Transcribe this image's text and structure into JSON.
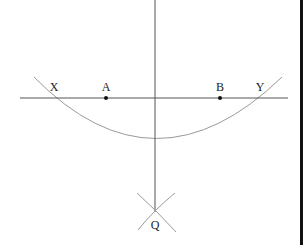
{
  "diagram": {
    "colors": {
      "line": "#555555",
      "arc": "#9a9a9a",
      "point": "#111111",
      "label": "#222222",
      "edge_bar": "#111111"
    },
    "horizontal_line": {
      "x1": 20,
      "y1": 98,
      "x2": 288,
      "y2": 98
    },
    "vertical_line": {
      "x1": 155,
      "y1": 0,
      "x2": 155,
      "y2": 212
    },
    "points": [
      {
        "id": "A",
        "label": "A",
        "x": 106,
        "y": 98,
        "label_x": 106,
        "label_y": 91
      },
      {
        "id": "B",
        "label": "B",
        "x": 220,
        "y": 98,
        "label_x": 220,
        "label_y": 91
      }
    ],
    "intersections": [
      {
        "id": "X",
        "label": "X",
        "label_x": 54,
        "label_y": 91
      },
      {
        "id": "Y",
        "label": "Y",
        "label_x": 260,
        "label_y": 91
      },
      {
        "id": "Q",
        "label": "Q",
        "label_x": 155,
        "label_y": 229
      }
    ]
  }
}
